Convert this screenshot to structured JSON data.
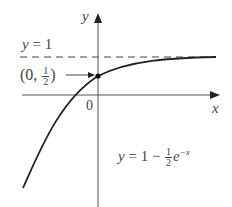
{
  "figure": {
    "axes": {
      "x_label": "x",
      "y_label": "y",
      "origin_label": "0"
    },
    "asymptote": {
      "label_lhs": "y",
      "label_eq": "=",
      "label_rhs": "1",
      "value": 1,
      "style": "dashed"
    },
    "point": {
      "label_open": "(0,",
      "label_num": "1",
      "label_den": "2",
      "label_close": ")",
      "x": 0,
      "y": 0.5
    },
    "curve": {
      "label_lhs": "y",
      "label_mid": "= 1 −",
      "label_num": "1",
      "label_den": "2",
      "label_base": "e",
      "label_exp": "−x",
      "function": "y = 1 - (1/2) e^(-x)"
    }
  }
}
